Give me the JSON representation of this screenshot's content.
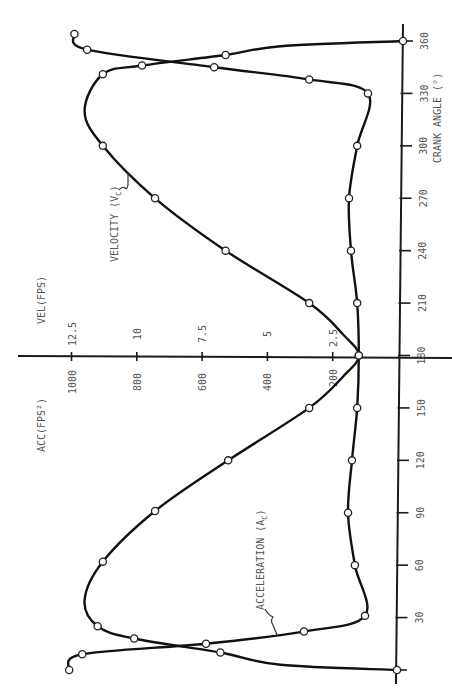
{
  "chart_data": {
    "type": "line",
    "orientation": "rotated-90",
    "title": "",
    "xlabel": "CRANK ANGLE (°)",
    "ylabel_left": "ACC(FPS²)",
    "ylabel_right": "VEL(FPS)",
    "x_ticks": [
      0,
      30,
      60,
      90,
      120,
      150,
      180,
      210,
      240,
      270,
      300,
      330,
      360
    ],
    "x_tick_labels": [
      "30",
      "60",
      "90",
      "120",
      "150",
      "180",
      "210",
      "240",
      "270",
      "300",
      "330",
      "360"
    ],
    "acc_ticks": [
      200,
      400,
      600,
      800,
      1000
    ],
    "acc_tick_labels": [
      "200",
      "400",
      "600",
      "800",
      "1000"
    ],
    "vel_ticks": [
      2.5,
      5,
      7.5,
      10,
      12.5
    ],
    "vel_tick_labels": [
      "2.5",
      "5",
      "7.5",
      "10",
      "12.5"
    ],
    "xlim": [
      0,
      360
    ],
    "acc_lim": [
      0,
      1000
    ],
    "vel_lim": [
      0,
      12.5
    ],
    "grid": false,
    "series": [
      {
        "name": "VELOCITY (VC)",
        "label": "VELOCITY (V",
        "label_sub": "C",
        "unit": "fps",
        "points": [
          {
            "x": 0,
            "y": 0,
            "marker": true
          },
          {
            "x": 3,
            "y": 4.5,
            "marker": false
          },
          {
            "x": 10,
            "y": 6.8,
            "marker": true
          },
          {
            "x": 18,
            "y": 10.1,
            "marker": true
          },
          {
            "x": 25,
            "y": 11.5,
            "marker": true
          },
          {
            "x": 40,
            "y": 12.0,
            "marker": false
          },
          {
            "x": 62,
            "y": 11.3,
            "marker": true
          },
          {
            "x": 91,
            "y": 9.3,
            "marker": true
          },
          {
            "x": 120,
            "y": 6.5,
            "marker": true
          },
          {
            "x": 150,
            "y": 3.4,
            "marker": true
          },
          {
            "x": 168,
            "y": 2.1,
            "marker": false
          },
          {
            "x": 180,
            "y": 1.5,
            "marker": true
          },
          {
            "x": 192,
            "y": 2.1,
            "marker": false
          },
          {
            "x": 210,
            "y": 3.4,
            "marker": true
          },
          {
            "x": 240,
            "y": 6.6,
            "marker": true
          },
          {
            "x": 270,
            "y": 9.3,
            "marker": true
          },
          {
            "x": 300,
            "y": 11.3,
            "marker": true
          },
          {
            "x": 320,
            "y": 12.0,
            "marker": false
          },
          {
            "x": 341,
            "y": 11.3,
            "marker": true
          },
          {
            "x": 346,
            "y": 9.8,
            "marker": true
          },
          {
            "x": 352,
            "y": 6.6,
            "marker": true
          },
          {
            "x": 357,
            "y": 4.5,
            "marker": false
          },
          {
            "x": 360,
            "y": 0,
            "marker": true
          }
        ]
      },
      {
        "name": "ACCELERATION (AC)",
        "label": "ACCELERATION (A",
        "label_sub": "C",
        "unit": "fps²",
        "points": [
          {
            "x": 0,
            "y": 1007,
            "marker": true
          },
          {
            "x": 9,
            "y": 967,
            "marker": true
          },
          {
            "x": 15,
            "y": 588,
            "marker": true
          },
          {
            "x": 22,
            "y": 288,
            "marker": true
          },
          {
            "x": 31,
            "y": 101,
            "marker": true
          },
          {
            "x": 60,
            "y": 132,
            "marker": true
          },
          {
            "x": 90,
            "y": 153,
            "marker": true
          },
          {
            "x": 120,
            "y": 141,
            "marker": true
          },
          {
            "x": 150,
            "y": 125,
            "marker": true
          },
          {
            "x": 180,
            "y": 120,
            "marker": true
          },
          {
            "x": 210,
            "y": 125,
            "marker": true
          },
          {
            "x": 240,
            "y": 144,
            "marker": true
          },
          {
            "x": 270,
            "y": 150,
            "marker": true
          },
          {
            "x": 300,
            "y": 125,
            "marker": true
          },
          {
            "x": 330,
            "y": 92,
            "marker": true
          },
          {
            "x": 338,
            "y": 272,
            "marker": true
          },
          {
            "x": 345,
            "y": 563,
            "marker": true
          },
          {
            "x": 355,
            "y": 952,
            "marker": true
          },
          {
            "x": 364,
            "y": 991,
            "marker": true
          }
        ]
      }
    ]
  }
}
